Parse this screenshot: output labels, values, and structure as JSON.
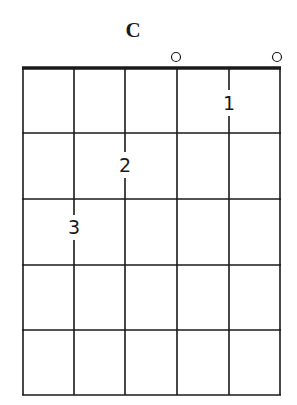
{
  "chord": {
    "name": "C",
    "strings": [
      "E",
      "A",
      "D",
      "G",
      "B",
      "e"
    ],
    "frets_shown": 5,
    "open_strings": [
      4,
      6
    ],
    "fingers": [
      {
        "string": 5,
        "fret": 3,
        "finger": "3"
      },
      {
        "string": 4,
        "fret": 2,
        "finger": "2"
      },
      {
        "string": 2,
        "fret": 1,
        "finger": "1"
      }
    ],
    "labels": {
      "finger_1": "1",
      "finger_2": "2",
      "finger_3": "3"
    }
  },
  "colors": {
    "line": "#1a1a1a",
    "background": "#ffffff"
  }
}
